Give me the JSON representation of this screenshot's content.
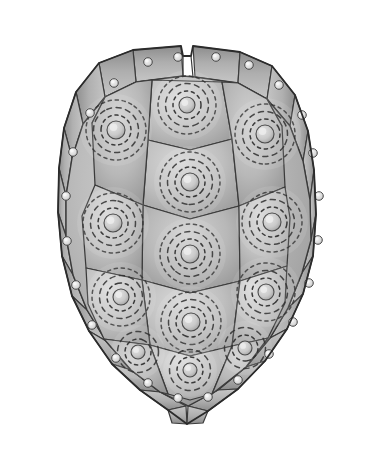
{
  "figure": {
    "title": "Turtle Carapace Dorsal View",
    "view": "dorsal",
    "medium": "grayscale-pencil-illustration",
    "background_color": "#ffffff",
    "canvas": {
      "width": 371,
      "height": 458
    }
  },
  "palette": {
    "paper": "#ffffff",
    "scute_light": "#cfcfcf",
    "scute_mid": "#b4b4b4",
    "scute_dark": "#9a9a9a",
    "scute_shadow": "#7f7f7f",
    "seam_line": "#3a3a3a",
    "outline": "#2b2b2b",
    "ring_dash": "#2e2e2e",
    "pore_highlight": "#e8e8e8",
    "areola_highlight": "#dcdcdc"
  },
  "anatomy": {
    "outline_extents": {
      "left": 58,
      "right": 318,
      "top": 44,
      "bottom": 424
    },
    "midline_x": 187,
    "nuchal_notch": {
      "x": 187,
      "y": 46,
      "width": 10,
      "depth": 6
    },
    "counts": {
      "vertebral_scutes": 5,
      "costal_scutes": 8,
      "costal_pairs": 4,
      "marginal_scutes": 24,
      "supracaudal_scutes": 1,
      "nuchal_scutes": 1
    }
  },
  "vertebral_scutes": [
    {
      "id": "V1",
      "label": "vertebral-1",
      "cx": 187,
      "cy": 105,
      "ring_count": 3,
      "areola_r": 8
    },
    {
      "id": "V2",
      "label": "vertebral-2",
      "cx": 190,
      "cy": 182,
      "ring_count": 3,
      "areola_r": 9
    },
    {
      "id": "V3",
      "label": "vertebral-3",
      "cx": 190,
      "cy": 254,
      "ring_count": 3,
      "areola_r": 9
    },
    {
      "id": "V4",
      "label": "vertebral-4",
      "cx": 191,
      "cy": 322,
      "ring_count": 3,
      "areola_r": 9
    },
    {
      "id": "V5",
      "label": "vertebral-5",
      "cx": 190,
      "cy": 370,
      "ring_count": 2,
      "areola_r": 7
    }
  ],
  "costal_scutes": [
    {
      "id": "L1",
      "label": "costal-left-1",
      "cx": 116,
      "cy": 130,
      "ring_count": 3,
      "areola_r": 9
    },
    {
      "id": "L2",
      "label": "costal-left-2",
      "cx": 113,
      "cy": 223,
      "ring_count": 3,
      "areola_r": 9
    },
    {
      "id": "L3",
      "label": "costal-left-3",
      "cx": 121,
      "cy": 297,
      "ring_count": 3,
      "areola_r": 8
    },
    {
      "id": "L4",
      "label": "costal-left-4",
      "cx": 138,
      "cy": 352,
      "ring_count": 2,
      "areola_r": 7
    },
    {
      "id": "R1",
      "label": "costal-right-1",
      "cx": 265,
      "cy": 134,
      "ring_count": 3,
      "areola_r": 9
    },
    {
      "id": "R2",
      "label": "costal-right-2",
      "cx": 272,
      "cy": 222,
      "ring_count": 3,
      "areola_r": 9
    },
    {
      "id": "R3",
      "label": "costal-right-3",
      "cx": 266,
      "cy": 292,
      "ring_count": 3,
      "areola_r": 8
    },
    {
      "id": "R4",
      "label": "costal-right-4",
      "cx": 245,
      "cy": 348,
      "ring_count": 2,
      "areola_r": 7
    }
  ],
  "marginal_pores": [
    {
      "cx": 148,
      "cy": 62
    },
    {
      "cx": 178,
      "cy": 57
    },
    {
      "cx": 216,
      "cy": 57
    },
    {
      "cx": 249,
      "cy": 65
    },
    {
      "cx": 114,
      "cy": 83
    },
    {
      "cx": 279,
      "cy": 85
    },
    {
      "cx": 90,
      "cy": 113
    },
    {
      "cx": 302,
      "cy": 115
    },
    {
      "cx": 73,
      "cy": 152
    },
    {
      "cx": 313,
      "cy": 153
    },
    {
      "cx": 66,
      "cy": 196
    },
    {
      "cx": 319,
      "cy": 196
    },
    {
      "cx": 67,
      "cy": 241
    },
    {
      "cx": 318,
      "cy": 240
    },
    {
      "cx": 76,
      "cy": 285
    },
    {
      "cx": 309,
      "cy": 283
    },
    {
      "cx": 92,
      "cy": 325
    },
    {
      "cx": 293,
      "cy": 322
    },
    {
      "cx": 116,
      "cy": 358
    },
    {
      "cx": 269,
      "cy": 354
    },
    {
      "cx": 148,
      "cy": 383
    },
    {
      "cx": 238,
      "cy": 380
    },
    {
      "cx": 178,
      "cy": 398
    },
    {
      "cx": 208,
      "cy": 397
    }
  ],
  "notes": {
    "ring_style": "dashed concentric growth annuli",
    "areola_style": "small raised pale nucleus at scute centre",
    "shading": "soft graphite gradient, darker toward scute margins and shell rim"
  }
}
